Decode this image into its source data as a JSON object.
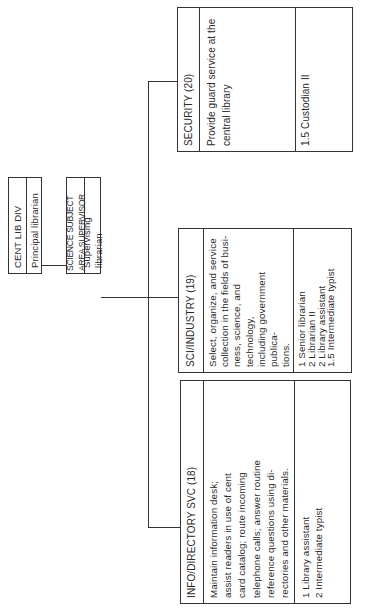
{
  "chart": {
    "root": {
      "name": "CENT LIB DIV",
      "position": "Principal  librarian"
    },
    "supervisor": {
      "name": "SCIENCE SUBJECT AREA SUPERVISOR",
      "position": "Supervising  librarian"
    },
    "units": [
      {
        "title": "INFO/DIRECTORY SVC    (18)",
        "description": "Maintain information desk;\nassist readers in use of cent\ncard catalog; route incoming\ntelephone calls; answer routine\nreference questions using di-\nrectories and other materials.",
        "staff": "1  Library assistant\n2  Intermediate typist"
      },
      {
        "title": "SCI/INDUSTRY    (19)",
        "description": "Select, organize, and service\ncollection in the fields of busi-\nness, science, and technology,\nincluding government publica-\ntions.",
        "staff": "1  Senior librarian\n2  Librarian II\n2  Library assistant\n1.5  Intermediate typist"
      },
      {
        "title": "SECURITY   (20)",
        "description": "Provide guard service at the\ncentral  library",
        "staff": "1.5 Custodian II"
      }
    ]
  }
}
